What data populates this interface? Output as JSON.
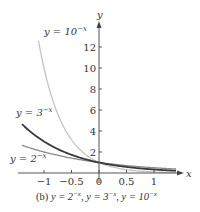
{
  "chart_data": {
    "type": "line",
    "title": "",
    "caption": "(b) y = 2^{-x}, y = 3^{-x}, y = 10^{-x}",
    "xlabel": "x",
    "ylabel": "y",
    "xlim": [
      -1.45,
      1.45
    ],
    "ylim": [
      0,
      14
    ],
    "grid": false,
    "xticks": [
      -1,
      -0.5,
      0,
      0.5,
      1
    ],
    "xtick_labels": [
      "−1",
      "−0.5",
      "0",
      "0.5",
      "1"
    ],
    "yticks": [
      2,
      4,
      6,
      8,
      10,
      12
    ],
    "ytick_labels": [
      "2",
      "4",
      "6",
      "8",
      "10",
      "12"
    ],
    "series": [
      {
        "name": "y = 2^{-x}",
        "base": 2,
        "color": "#8a8a8a",
        "x": [
          -1.4,
          -1,
          -0.5,
          0,
          0.5,
          1,
          1.4
        ],
        "values": [
          2.64,
          2.0,
          1.41,
          1.0,
          0.71,
          0.5,
          0.38
        ]
      },
      {
        "name": "y = 3^{-x}",
        "base": 3,
        "color": "#3a3a3a",
        "x": [
          -1.4,
          -1,
          -0.5,
          0,
          0.5,
          1,
          1.4
        ],
        "values": [
          4.66,
          3.0,
          1.73,
          1.0,
          0.58,
          0.33,
          0.21
        ]
      },
      {
        "name": "y = 10^{-x}",
        "base": 10,
        "color": "#c4c4c4",
        "x": [
          -1.1,
          -1,
          -0.5,
          0,
          0.5,
          1,
          1.4
        ],
        "values": [
          12.59,
          10.0,
          3.16,
          1.0,
          0.32,
          0.1,
          0.04
        ]
      }
    ],
    "annotations": [
      {
        "text": "y = 10^{-x}",
        "near": "top-left of steep curve"
      },
      {
        "text": "y = 3^{-x}",
        "near": "left, above dark curve"
      },
      {
        "text": "y = 2^{-x}",
        "near": "left, below gray curve"
      }
    ]
  },
  "labels": {
    "axis_x": "x",
    "axis_y": "y",
    "curve_10": {
      "prefix": "y = 10",
      "exp": "−x"
    },
    "curve_3": {
      "prefix": "y = 3",
      "exp": "−x"
    },
    "curve_2": {
      "prefix": "y = 2",
      "exp": "−x"
    },
    "caption_prefix": "(b) ",
    "caption_parts": [
      {
        "base": "y = 2",
        "exp": "−x",
        "sep": ", "
      },
      {
        "base": "y = 3",
        "exp": "−x",
        "sep": ", "
      },
      {
        "base": "y = 10",
        "exp": "−x",
        "sep": ""
      }
    ]
  }
}
